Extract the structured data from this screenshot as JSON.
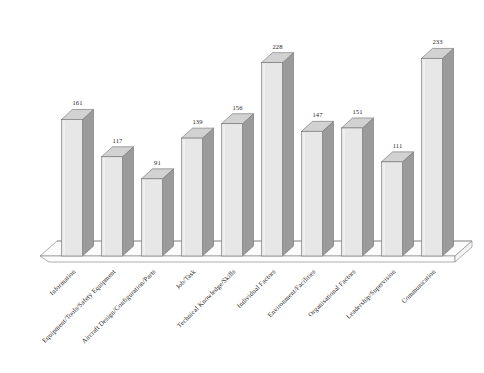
{
  "chart_data": {
    "type": "bar",
    "title": "",
    "subtitle": "",
    "xlabel": "",
    "ylabel": "",
    "grid": false,
    "legend": false,
    "legend_position": "none",
    "three_d": true,
    "ylim": [
      0,
      250
    ],
    "categories": [
      "Information",
      "Equipment/Tools/Safety Equipment",
      "Aircraft Design/Configuration/Parts",
      "Job/Task",
      "Technical Knowledge/Skills",
      "Individual Factors",
      "Environment/Facilities",
      "Organisational Factors",
      "Leadership/Supervision",
      "Communication"
    ],
    "values": [
      161,
      117,
      91,
      139,
      156,
      228,
      147,
      151,
      111,
      233
    ],
    "data_labels": [
      "161",
      "117",
      "91",
      "139",
      "156",
      "228",
      "147",
      "151",
      "111",
      "233"
    ],
    "colors": {
      "bar_front": "#e7e7e7",
      "bar_top": "#d2d2d2",
      "bar_side": "#9b9b9b",
      "bar_outline": "#6e6e6e",
      "floor_fill": "#fbfbfb",
      "floor_outline": "#8d8d8d",
      "background": "#ffffff",
      "label_text": "#2a2a2a"
    }
  }
}
